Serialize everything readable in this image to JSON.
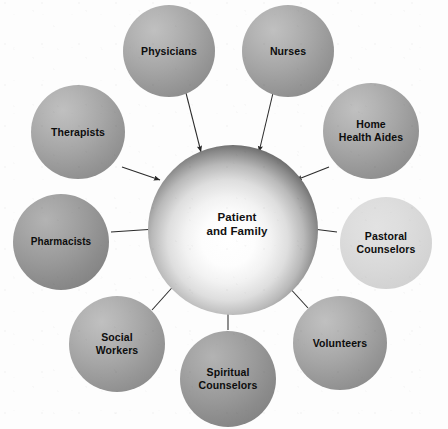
{
  "diagram": {
    "type": "hub-and-spoke",
    "background_color": "#fdfdfd",
    "hub": {
      "label_line1": "Patient",
      "label_line2": "and Family",
      "center": [
        233,
        230
      ],
      "radius": 85,
      "fill_style": "radial-gradient-light-center-dark-rim",
      "core_color": "#ffffff",
      "rim_color": "#000000"
    },
    "arrow_color": "#2b2b2b",
    "satellites": [
      {
        "id": "physicians",
        "label_line1": "Physicians",
        "label_line2": "",
        "center": [
          169,
          51
        ],
        "radius": 46,
        "tone": "mid",
        "fill_color": "#a0a0a0",
        "arrow_to_hub": true
      },
      {
        "id": "nurses",
        "label_line1": "Nurses",
        "label_line2": "",
        "center": [
          288,
          51
        ],
        "radius": 46,
        "tone": "mid",
        "fill_color": "#a0a0a0",
        "arrow_to_hub": true
      },
      {
        "id": "home-health-aides",
        "label_line1": "Home",
        "label_line2": "Health Aides",
        "center": [
          371,
          131
        ],
        "radius": 48,
        "tone": "mid",
        "fill_color": "#9e9e9e",
        "arrow_to_hub": true
      },
      {
        "id": "pastoral-counselors",
        "label_line1": "Pastoral",
        "label_line2": "Counselors",
        "center": [
          386,
          243
        ],
        "radius": 46,
        "tone": "light",
        "fill_color": "#d8d8d8",
        "arrow_to_hub": true
      },
      {
        "id": "volunteers",
        "label_line1": "Volunteers",
        "label_line2": "",
        "center": [
          340,
          343
        ],
        "radius": 47,
        "tone": "mid",
        "fill_color": "#a3a3a3",
        "arrow_to_hub": true
      },
      {
        "id": "spiritual-counselors",
        "label_line1": "Spiritual",
        "label_line2": "Counselors",
        "center": [
          228,
          379
        ],
        "radius": 48,
        "tone": "dark",
        "fill_color": "#949494",
        "arrow_to_hub": true
      },
      {
        "id": "social-workers",
        "label_line1": "Social",
        "label_line2": "Workers",
        "center": [
          117,
          344
        ],
        "radius": 48,
        "tone": "mid",
        "fill_color": "#9c9c9c",
        "arrow_to_hub": true
      },
      {
        "id": "pharmacists",
        "label_line1": "Pharmacists",
        "label_line2": "",
        "center": [
          61,
          242
        ],
        "radius": 48,
        "tone": "dark",
        "fill_color": "#949494",
        "arrow_to_hub": true
      },
      {
        "id": "therapists",
        "label_line1": "Therapists",
        "label_line2": "",
        "center": [
          78,
          132
        ],
        "radius": 47,
        "tone": "mid",
        "fill_color": "#9e9e9e",
        "arrow_to_hub": true
      }
    ]
  }
}
